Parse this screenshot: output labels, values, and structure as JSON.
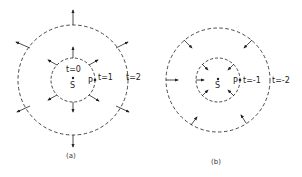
{
  "panels": [
    {
      "id": "a",
      "caption": "(a)",
      "center_label": "S",
      "start_label": "t=0",
      "point_label": "P",
      "inner_label": "t=1",
      "outer_label": "t=2",
      "arrow_direction": "outward"
    },
    {
      "id": "b",
      "caption": "(b)",
      "center_label": "S",
      "point_label": "P",
      "inner_label": "t=-1",
      "outer_label": "t=-2",
      "arrow_direction": "inward"
    }
  ]
}
